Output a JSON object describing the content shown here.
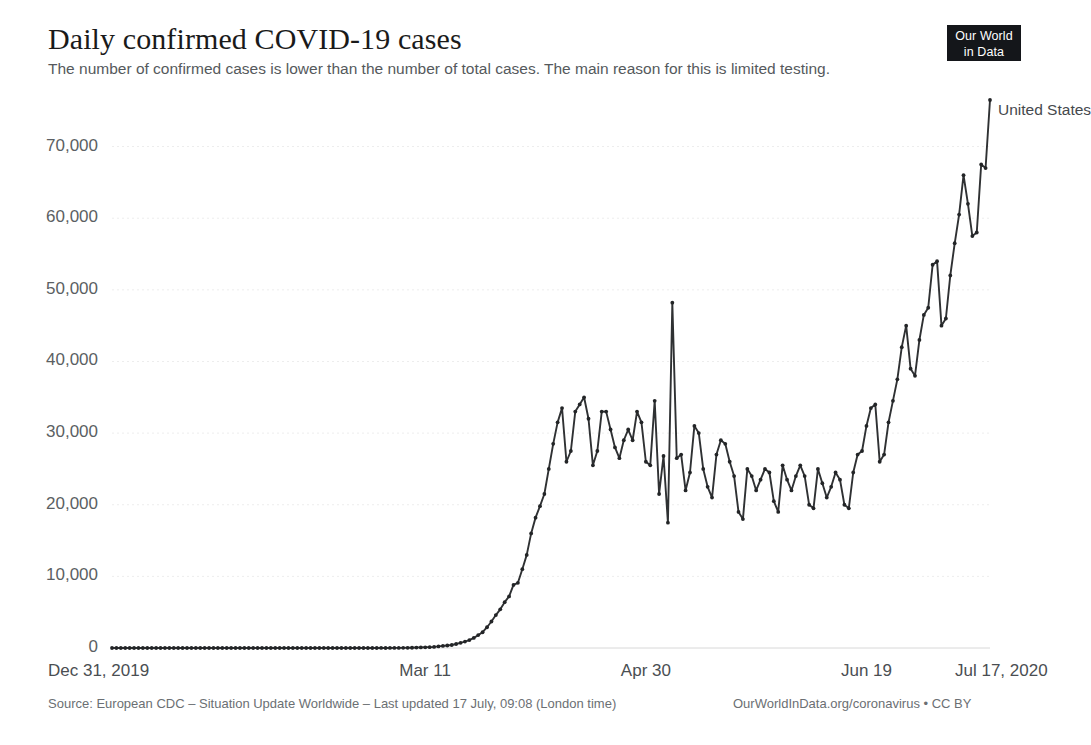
{
  "header": {
    "title": "Daily confirmed COVID-19 cases",
    "subtitle": "The number of confirmed cases is lower than the number of total cases. The main reason for this is limited testing.",
    "logo_line1": "Our World",
    "logo_line2": "in Data"
  },
  "footer": {
    "source": "Source: European CDC – Situation Update Worldwide – Last updated 17 July, 09:08 (London time)",
    "credit": "OurWorldInData.org/coronavirus • CC BY"
  },
  "colors": {
    "line": "#2f3133",
    "marker": "#232527",
    "grid": "#ededed",
    "axis": "#d8d8d8",
    "tick_text": "#5b5f63",
    "title_text": "#1a1a1a",
    "subtitle_text": "#55595c",
    "footer_text": "#6b6f73",
    "logo_bg": "#14161a"
  },
  "chart_data": {
    "type": "line",
    "title": "Daily confirmed COVID-19 cases",
    "subtitle": "The number of confirmed cases is lower than the number of total cases. The main reason for this is limited testing.",
    "xlabel": "",
    "ylabel": "",
    "grid": true,
    "legend_position": "line-end-right",
    "ylim": [
      0,
      76500
    ],
    "y_ticks": [
      0,
      10000,
      20000,
      30000,
      40000,
      50000,
      60000,
      70000
    ],
    "y_tick_labels": [
      "0",
      "10,000",
      "20,000",
      "30,000",
      "40,000",
      "50,000",
      "60,000",
      "70,000"
    ],
    "x_tick_indices": [
      0,
      71,
      121,
      171,
      199
    ],
    "x_tick_labels": [
      "Dec 31, 2019",
      "Mar 11",
      "Apr 30",
      "Jun 19",
      "Jul 17, 2020"
    ],
    "x_start": "Dec 31, 2019",
    "x_end": "Jul 17, 2020",
    "series": [
      {
        "name": "United States",
        "color": "#2f3133",
        "values": [
          0,
          0,
          0,
          0,
          0,
          0,
          0,
          0,
          0,
          0,
          0,
          0,
          0,
          0,
          0,
          0,
          0,
          0,
          0,
          0,
          0,
          1,
          0,
          0,
          1,
          0,
          0,
          1,
          0,
          2,
          0,
          0,
          0,
          1,
          0,
          0,
          1,
          0,
          0,
          0,
          0,
          1,
          0,
          0,
          0,
          1,
          0,
          0,
          0,
          0,
          0,
          0,
          0,
          0,
          0,
          0,
          0,
          0,
          0,
          0,
          2,
          4,
          3,
          8,
          12,
          17,
          22,
          26,
          35,
          60,
          87,
          101,
          120,
          150,
          220,
          290,
          350,
          420,
          560,
          720,
          890,
          1100,
          1400,
          1800,
          2200,
          2900,
          3700,
          4600,
          5400,
          6400,
          7200,
          8800,
          9100,
          11000,
          13000,
          16000,
          18200,
          19800,
          21500,
          25000,
          28500,
          31500,
          33500,
          26000,
          27500,
          33000,
          34000,
          35000,
          32000,
          25500,
          27500,
          33000,
          33000,
          30500,
          28000,
          26500,
          29000,
          30500,
          29000,
          33000,
          31500,
          26000,
          25500,
          34500,
          21500,
          26800,
          17500,
          48200,
          26500,
          27000,
          22000,
          24500,
          31000,
          30000,
          25000,
          22500,
          21000,
          27000,
          29000,
          28500,
          26000,
          24000,
          19000,
          18000,
          25000,
          24000,
          22000,
          23500,
          25000,
          24500,
          20500,
          19000,
          25500,
          23500,
          22000,
          24000,
          25500,
          24000,
          20000,
          19500,
          25000,
          23000,
          21000,
          22500,
          24500,
          23500,
          20000,
          19500,
          24500,
          27000,
          27500,
          31000,
          33500,
          34000,
          26000,
          27000,
          31500,
          34500,
          37500,
          42000,
          45000,
          39000,
          38000,
          43000,
          46500,
          47500,
          53500,
          54000,
          45000,
          46000,
          52000,
          56500,
          60500,
          66000,
          62000,
          57500,
          58000,
          67500,
          67000,
          76500
        ]
      }
    ]
  },
  "series_label": {
    "text": "United States"
  }
}
